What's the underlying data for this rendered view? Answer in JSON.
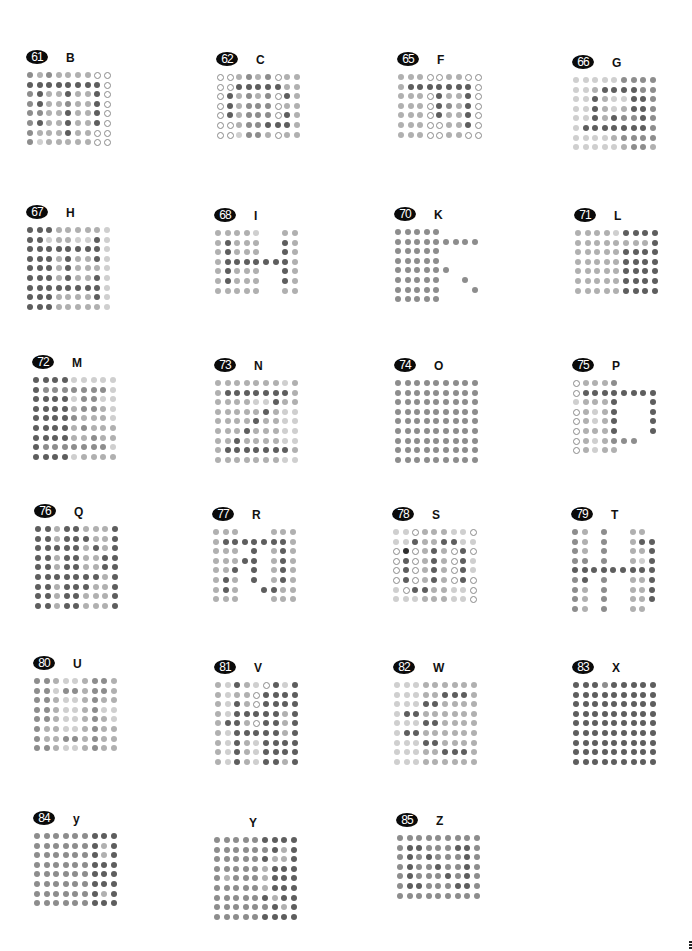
{
  "page": {
    "background": "#ffffff"
  },
  "legend": {
    "0": "no dot",
    "1": "hollow ring",
    "2": "very light gray dot",
    "3": "light gray dot",
    "4": "medium gray dot",
    "5": "dark gray dot",
    "6": "near-black dot"
  },
  "panels": [
    {
      "number": "61",
      "letter": "B",
      "x": 26,
      "y": 50,
      "grid": [
        "434333311",
        "555555551",
        "453353351",
        "453343351",
        "443353351",
        "453353351",
        "433353311",
        "423333311"
      ]
    },
    {
      "number": "62",
      "letter": "C",
      "x": 216,
      "y": 52,
      "grid": [
        "113434133",
        "115555533",
        "153434153",
        "153444133",
        "153444153",
        "113445553",
        "112443133"
      ]
    },
    {
      "number": "65",
      "letter": "F",
      "x": 397,
      "y": 52,
      "grid": [
        "333113311",
        "355555551",
        "333153351",
        "333154351",
        "333153351",
        "333113351",
        "333113311"
      ]
    },
    {
      "number": "66",
      "letter": "G",
      "x": 572,
      "y": 55,
      "grid": [
        "222224444",
        "223555544",
        "225322554",
        "225323554",
        "225354454",
        "255555554",
        "222234444",
        "222223443"
      ]
    },
    {
      "number": "67",
      "letter": "H",
      "x": 26,
      "y": 205,
      "grid": [
        "555333332",
        "552332252",
        "555555552",
        "555353352",
        "555353332",
        "555353352",
        "555555552",
        "555333352",
        "555333332"
      ]
    },
    {
      "number": "68",
      "letter": "I",
      "x": 214,
      "y": 208,
      "grid": [
        "333320033",
        "353330053",
        "353330053",
        "355555553",
        "353330053",
        "353330053",
        "333330033"
      ]
    },
    {
      "number": "70",
      "letter": "K",
      "x": 394,
      "y": 207,
      "grid": [
        "444440000",
        "444444444",
        "444440000",
        "444440000",
        "444444000",
        "444440040",
        "444440004",
        "444440000"
      ]
    },
    {
      "number": "71",
      "letter": "L",
      "x": 574,
      "y": 208,
      "grid": [
        "333325555",
        "333333335",
        "333335555",
        "333335555",
        "333335555",
        "333335555",
        "333335555"
      ]
    },
    {
      "number": "72",
      "letter": "M",
      "x": 32,
      "y": 355,
      "grid": [
        "555522222",
        "544444442",
        "555524422",
        "555534432",
        "555543332",
        "555534333",
        "555533433",
        "544444442",
        "555523333"
      ]
    },
    {
      "number": "73",
      "letter": "N",
      "x": 214,
      "y": 358,
      "grid": [
        "333333323",
        "355555553",
        "333322533",
        "333335322",
        "333353322",
        "333533322",
        "335333322",
        "355555553",
        "333333322"
      ]
    },
    {
      "number": "74",
      "letter": "O",
      "x": 394,
      "y": 358,
      "grid": [
        "444444444",
        "444444444",
        "444444444",
        "444444444",
        "444444444",
        "444444444",
        "444444444",
        "444444444",
        "444444444"
      ]
    },
    {
      "number": "75",
      "letter": "P",
      "x": 572,
      "y": 358,
      "grid": [
        "133340000",
        "155555555",
        "233350005",
        "132350005",
        "132350005",
        "133350005",
        "132344400",
        "132330000"
      ]
    },
    {
      "number": "76",
      "letter": "Q",
      "x": 34,
      "y": 504,
      "grid": [
        "553553335",
        "553555335",
        "555553535",
        "553553355",
        "553553355",
        "555555535",
        "553555335",
        "553553335",
        "553553335"
      ]
    },
    {
      "number": "77",
      "letter": "R",
      "x": 212,
      "y": 507,
      "grid": [
        "333000333",
        "355555553",
        "333050353",
        "333550353",
        "335050353",
        "353050353",
        "353005533",
        "333000333"
      ]
    },
    {
      "number": "78",
      "letter": "S",
      "x": 392,
      "y": 507,
      "grid": [
        "221333221",
        "225335522",
        "161353151",
        "151353152",
        "151353152",
        "151353151",
        "215533221",
        "222333221"
      ]
    },
    {
      "number": "79",
      "letter": "T",
      "x": 571,
      "y": 507,
      "grid": [
        "430400330",
        "430400355",
        "430400335",
        "440400325",
        "555555555",
        "450400335",
        "430400335",
        "430400335",
        "430400330"
      ]
    },
    {
      "number": "80",
      "letter": "U",
      "x": 33,
      "y": 656,
      "grid": [
        "443223443",
        "442443443",
        "443223433",
        "443223422",
        "443223432",
        "433223433",
        "433443433",
        "443223433"
      ]
    },
    {
      "number": "81",
      "letter": "V",
      "x": 214,
      "y": 660,
      "grid": [
        "325321525",
        "323315555",
        "325315555",
        "325555535",
        "355315535",
        "325555535",
        "325325555",
        "325325555",
        "325325535"
      ]
    },
    {
      "number": "82",
      "letter": "W",
      "x": 393,
      "y": 660,
      "grid": [
        "222333333",
        "222335553",
        "222553333",
        "255333333",
        "222553333",
        "255333333",
        "222553333",
        "222335553",
        "222333333"
      ]
    },
    {
      "number": "83",
      "letter": "X",
      "x": 572,
      "y": 660,
      "grid": [
        "555455555",
        "555555555",
        "555555555",
        "555555555",
        "555555555",
        "555555555",
        "555555555",
        "555555555",
        "555555555"
      ]
    },
    {
      "number": "84",
      "letter": "y",
      "x": 33,
      "y": 811,
      "grid": [
        "444444555",
        "444444535",
        "444444535",
        "444444555",
        "444444555",
        "444444555",
        "444444535",
        "444444555"
      ]
    },
    {
      "number": "",
      "letter": "Y",
      "x": 213,
      "y": 815,
      "grid": [
        "444445555",
        "444444535",
        "444445335",
        "444443555",
        "434443555",
        "444443555",
        "444445355",
        "444444535",
        "444445555"
      ]
    },
    {
      "number": "85",
      "letter": "Z",
      "x": 396,
      "y": 813,
      "grid": [
        "444444444",
        "455444554",
        "454544454",
        "454454454",
        "454445454",
        "455444554",
        "444444444"
      ]
    }
  ],
  "corner_mark": {
    "visible": true
  }
}
